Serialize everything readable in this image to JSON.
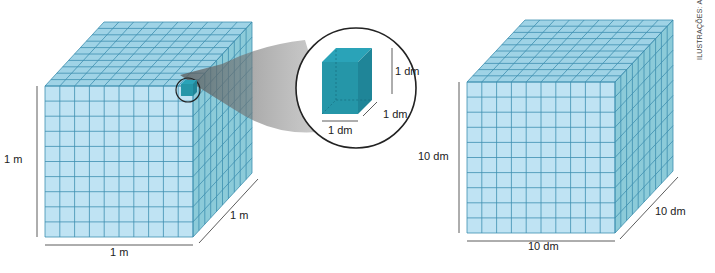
{
  "left_cube": {
    "height_label": "1 m",
    "width_label": "1 m",
    "depth_label": "1 m",
    "grid_divisions": 10
  },
  "zoom_inset": {
    "height_label": "1 dm",
    "width_label": "1 dm",
    "depth_label": "1 dm"
  },
  "right_cube": {
    "height_label": "10 dm",
    "width_label": "10 dm",
    "depth_label": "10 dm",
    "grid_divisions": 10
  },
  "credit": "ILUSTRAÇÕES: ADILSON SECCO",
  "colors": {
    "cube_front": "#bfe3f3",
    "cube_top": "#9fd3e6",
    "cube_side": "#8ccbd9",
    "grid_line": "#3d8fb0",
    "small_cube": "#2596a8"
  }
}
